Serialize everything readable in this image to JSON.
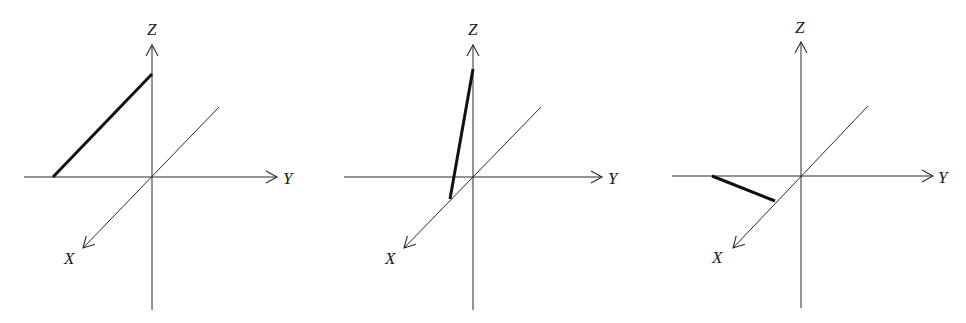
{
  "figure": {
    "panels": [
      {
        "id": "panel-1",
        "labels": {
          "z": "Z",
          "y": "Y",
          "x": "X"
        },
        "origin": [
          152,
          177
        ],
        "z_axis": {
          "top": [
            152,
            45
          ],
          "bottom": [
            152,
            310
          ],
          "label_pos": [
            147,
            35
          ]
        },
        "y_axis": {
          "left": [
            24,
            177
          ],
          "right": [
            277,
            177
          ],
          "label_pos": [
            283,
            184
          ]
        },
        "x_axis": {
          "back": [
            219,
            107
          ],
          "front": [
            83,
            248
          ],
          "label_pos": [
            64,
            264
          ]
        },
        "segment": {
          "from": [
            53,
            177
          ],
          "to": [
            152,
            74
          ],
          "description": "line from negative Y axis to positive Z axis"
        }
      },
      {
        "id": "panel-2",
        "labels": {
          "z": "Z",
          "y": "Y",
          "x": "X"
        },
        "origin": [
          473,
          177
        ],
        "z_axis": {
          "top": [
            473,
            45
          ],
          "bottom": [
            473,
            310
          ],
          "label_pos": [
            468,
            35
          ]
        },
        "y_axis": {
          "left": [
            344,
            177
          ],
          "right": [
            602,
            177
          ],
          "label_pos": [
            608,
            184
          ]
        },
        "x_axis": {
          "back": [
            541,
            107
          ],
          "front": [
            404,
            248
          ],
          "label_pos": [
            385,
            264
          ]
        },
        "segment": {
          "from": [
            450,
            199
          ],
          "to": [
            473,
            69
          ],
          "description": "line from positive X axis to positive Z axis"
        }
      },
      {
        "id": "panel-3",
        "labels": {
          "z": "Z",
          "y": "Y",
          "x": "X"
        },
        "origin": [
          801,
          176
        ],
        "z_axis": {
          "top": [
            801,
            42
          ],
          "bottom": [
            801,
            308
          ],
          "label_pos": [
            795,
            33
          ]
        },
        "y_axis": {
          "left": [
            672,
            176
          ],
          "right": [
            933,
            176
          ],
          "label_pos": [
            938,
            183
          ]
        },
        "x_axis": {
          "back": [
            868,
            106
          ],
          "front": [
            733,
            248
          ],
          "label_pos": [
            712,
            263
          ]
        },
        "segment": {
          "from": [
            712,
            176
          ],
          "to": [
            775,
            201
          ],
          "description": "line from negative Y axis to positive X axis"
        }
      }
    ]
  }
}
